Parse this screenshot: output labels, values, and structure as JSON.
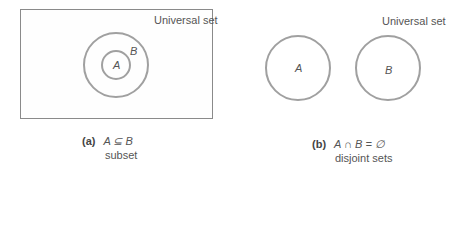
{
  "panels": [
    {
      "id": "a",
      "universal_label": "Universal set",
      "circle_labels": [
        "A",
        "B"
      ],
      "caption_tag": "(a)",
      "caption_expr": "A ⊆ B",
      "caption_desc": "subset"
    },
    {
      "id": "b",
      "universal_label": "Universal set",
      "circle_labels": [
        "A",
        "B"
      ],
      "caption_tag": "(b)",
      "caption_expr": "A ∩ B = ∅",
      "caption_desc": "disjoint sets"
    }
  ],
  "colors": {
    "circle": "#a0a0a0",
    "border": "#8a8a8a",
    "text": "#555555"
  }
}
